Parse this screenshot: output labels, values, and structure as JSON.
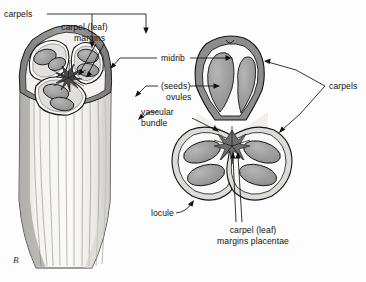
{
  "figure": {
    "panel_label": "B",
    "title": "",
    "background_color": "#fdfdfd",
    "ink_color": "#111111"
  },
  "labels": {
    "carpels_left": "carpels",
    "carpel_leaf_margins_line1": "carpel (leaf)",
    "carpel_leaf_margins_line2": "margins",
    "midrib": "midrib",
    "seeds_line1": "(seeds)",
    "seeds_line2": "ovules",
    "vascular_line1": "vascular",
    "vascular_line2": "bundle",
    "carpels_right": "carpels",
    "locule": "locule",
    "placentae_line1": "carpel (leaf)",
    "placentae_line2": "margins placentae"
  },
  "palette": {
    "outer_wall_dark": "#8f8f8f",
    "outer_wall_mid": "#a8a8a8",
    "wall_light": "#d9d9d9",
    "wall_pale": "#eceae6",
    "ovule_fill": "#9e9e9e",
    "ovule_fill_light": "#b4b4b4",
    "stalk_pale": "#f2f1ee",
    "locule_white": "#fbfbfb",
    "outline": "#1a1a1a"
  },
  "parts": {
    "left_view": "cut-away three-dimensional ovary with carpel walls removed showing three locules and ovules on a striated tapering stalk",
    "right_view": "transverse section of a tricarpellate ovary with three locules, ovules attached at fused carpel margins (placentae)"
  }
}
